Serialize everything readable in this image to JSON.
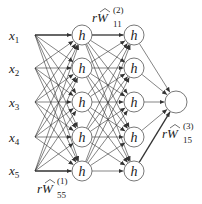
{
  "diagram": {
    "type": "neural-network",
    "inputs": [
      {
        "name": "x",
        "sub": "1"
      },
      {
        "name": "x",
        "sub": "2"
      },
      {
        "name": "x",
        "sub": "3"
      },
      {
        "name": "x",
        "sub": "4"
      },
      {
        "name": "x",
        "sub": "5"
      }
    ],
    "hidden_layers": [
      {
        "nodes": [
          "h",
          "h",
          "h",
          "h",
          "h"
        ]
      },
      {
        "nodes": [
          "h",
          "h",
          "h",
          "h",
          "h"
        ]
      }
    ],
    "output": {
      "label": ""
    },
    "edge_labels": {
      "w1": {
        "prefix": "r",
        "symbol": "W",
        "sup": "(1)",
        "sub": "55"
      },
      "w2": {
        "prefix": "r",
        "symbol": "W",
        "sup": "(2)",
        "sub": "11"
      },
      "w3": {
        "prefix": "r",
        "symbol": "W",
        "sup": "(3)",
        "sub": "15"
      }
    },
    "colors": {
      "stroke": "#333333",
      "text": "#222222",
      "node_fill": "#ffffff"
    }
  }
}
